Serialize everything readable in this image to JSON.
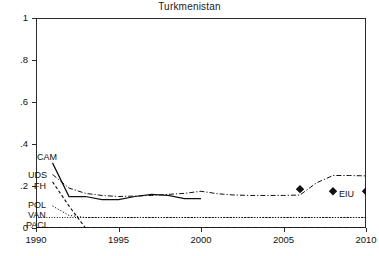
{
  "chart_data": {
    "type": "line",
    "title": "Turkmenistan",
    "xlabel": "",
    "ylabel": "",
    "xlim": [
      1990,
      2010
    ],
    "ylim": [
      0,
      1
    ],
    "grid": false,
    "legend_position": "inline-left",
    "xticks": [
      "1990",
      "1995",
      "2000",
      "2005",
      "2010"
    ],
    "xtick_values": [
      1990,
      1995,
      2000,
      2005,
      2010
    ],
    "yticks": [
      "0",
      ".2",
      ".4",
      ".6",
      ".8",
      "1"
    ],
    "ytick_values": [
      0,
      0.2,
      0.4,
      0.6,
      0.8,
      1
    ],
    "series": [
      {
        "name": "CAM",
        "style": "solid",
        "label": "CAM",
        "x": [
          1991,
          1992,
          1993,
          1994,
          1995,
          1996,
          1997,
          1998,
          1999,
          2000
        ],
        "values": [
          0.31,
          0.15,
          0.15,
          0.135,
          0.135,
          0.15,
          0.16,
          0.155,
          0.14,
          0.14
        ]
      },
      {
        "name": "UDS",
        "style": "dash-dot",
        "label": "UDS",
        "x": [
          1991,
          1992,
          1993,
          1994,
          1995,
          1996,
          1997,
          1998,
          1999,
          2000,
          2001,
          2002,
          2003,
          2004,
          2005,
          2006,
          2007,
          2008,
          2009,
          2010
        ],
        "values": [
          0.255,
          0.19,
          0.165,
          0.155,
          0.15,
          0.152,
          0.155,
          0.16,
          0.165,
          0.175,
          0.163,
          0.157,
          0.155,
          0.155,
          0.155,
          0.157,
          0.215,
          0.25,
          0.25,
          0.248
        ]
      },
      {
        "name": "FH",
        "style": "dashed",
        "label": "FH",
        "x": [
          1991,
          1992,
          1993
        ],
        "values": [
          0.22,
          0.105,
          0.0
        ]
      },
      {
        "name": "POL",
        "style": "dotted",
        "label": "POL",
        "x": [
          1991,
          1992,
          1993,
          1994,
          1995,
          2000,
          2005,
          2010
        ],
        "values": [
          0.105,
          0.06,
          0.05,
          0.05,
          0.05,
          0.05,
          0.05,
          0.05
        ]
      },
      {
        "name": "VAN",
        "style": "dotted-fine",
        "label": "VAN",
        "x": [
          1990,
          1995,
          2000,
          2005,
          2010
        ],
        "values": [
          0.05,
          0.05,
          0.05,
          0.05,
          0.05
        ]
      },
      {
        "name": "PACL",
        "style": "dashed-heavy",
        "label": "PACL",
        "x": [
          1990,
          1995,
          2000,
          2005,
          2010
        ],
        "values": [
          0.0,
          0.0,
          0.0,
          0.0,
          0.0
        ]
      }
    ],
    "markers": [
      {
        "name": "EIU",
        "x": 2006,
        "y": 0.185,
        "shape": "diamond"
      },
      {
        "name": "EIU",
        "x": 2008,
        "y": 0.175,
        "shape": "diamond"
      },
      {
        "name": "EIU",
        "x": 2010,
        "y": 0.175,
        "shape": "diamond"
      }
    ],
    "marker_label": "EIU",
    "colors": {
      "axis": "#2b2b2b",
      "line": "#111111",
      "background": "#ffffff"
    }
  }
}
